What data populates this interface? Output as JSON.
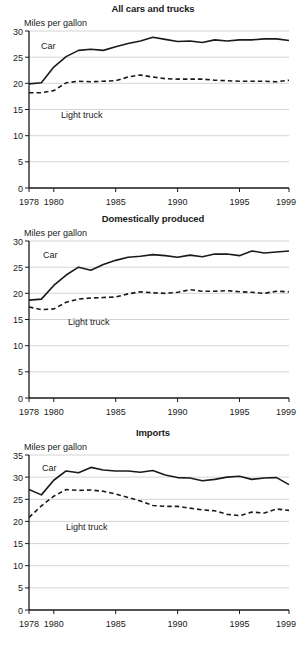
{
  "figure": {
    "panel_count": 3,
    "y_axis_title": "Miles per gallon",
    "series_names": [
      "Car",
      "Light truck"
    ],
    "colors": {
      "ink": "#1a1a1a",
      "gridline": "#c9c9c9",
      "background": "#ffffff"
    }
  },
  "chart_data": [
    {
      "type": "line",
      "title": "All cars and trucks",
      "xlabel": "",
      "ylabel": "Miles per gallon",
      "xlim": [
        1978,
        1999
      ],
      "ylim": [
        0,
        30
      ],
      "yticks": [
        0,
        5,
        10,
        15,
        20,
        25,
        30
      ],
      "xticks": [
        1978,
        1980,
        1985,
        1990,
        1995,
        1999
      ],
      "xtick_labels": [
        "1978",
        "1980",
        "1985",
        "1990",
        "1995",
        "1999"
      ],
      "ytick_labels": [
        "0",
        "5",
        "10",
        "15",
        "20",
        "25",
        "30"
      ],
      "grid": true,
      "legend": "inline-annotations",
      "x": [
        1978,
        1979,
        1980,
        1981,
        1982,
        1983,
        1984,
        1985,
        1986,
        1987,
        1988,
        1989,
        1990,
        1991,
        1992,
        1993,
        1994,
        1995,
        1996,
        1997,
        1998,
        1999
      ],
      "series": [
        {
          "name": "Car",
          "style": "solid",
          "values": [
            19.9,
            20.1,
            23.1,
            25.1,
            26.3,
            26.5,
            26.3,
            27.0,
            27.6,
            28.1,
            28.8,
            28.4,
            28.0,
            28.1,
            27.8,
            28.3,
            28.1,
            28.3,
            28.3,
            28.5,
            28.5,
            28.2
          ]
        },
        {
          "name": "Light truck",
          "style": "dashed",
          "values": [
            18.2,
            18.2,
            18.6,
            20.1,
            20.4,
            20.3,
            20.4,
            20.5,
            21.2,
            21.6,
            21.2,
            20.9,
            20.8,
            20.8,
            20.8,
            20.6,
            20.5,
            20.4,
            20.4,
            20.4,
            20.3,
            20.6
          ]
        }
      ]
    },
    {
      "type": "line",
      "title": "Domestically produced",
      "xlabel": "",
      "ylabel": "Miles per gallon",
      "xlim": [
        1978,
        1999
      ],
      "ylim": [
        0,
        30
      ],
      "yticks": [
        0,
        5,
        10,
        15,
        20,
        25,
        30
      ],
      "xticks": [
        1978,
        1980,
        1985,
        1990,
        1995,
        1999
      ],
      "xtick_labels": [
        "1978",
        "1980",
        "1985",
        "1990",
        "1995",
        "1999"
      ],
      "ytick_labels": [
        "0",
        "5",
        "10",
        "15",
        "20",
        "25",
        "30"
      ],
      "grid": true,
      "legend": "inline-annotations",
      "x": [
        1978,
        1979,
        1980,
        1981,
        1982,
        1983,
        1984,
        1985,
        1986,
        1987,
        1988,
        1989,
        1990,
        1991,
        1992,
        1993,
        1994,
        1995,
        1996,
        1997,
        1998,
        1999
      ],
      "series": [
        {
          "name": "Car",
          "style": "solid",
          "values": [
            18.7,
            18.9,
            21.5,
            23.5,
            25.0,
            24.4,
            25.5,
            26.3,
            26.9,
            27.1,
            27.4,
            27.2,
            26.9,
            27.3,
            27.0,
            27.5,
            27.5,
            27.2,
            28.1,
            27.7,
            27.9,
            28.1
          ]
        },
        {
          "name": "Light truck",
          "style": "dashed",
          "values": [
            17.4,
            16.9,
            17.0,
            18.3,
            18.9,
            19.1,
            19.2,
            19.3,
            19.9,
            20.3,
            20.1,
            20.0,
            20.2,
            20.7,
            20.4,
            20.4,
            20.5,
            20.3,
            20.2,
            20.0,
            20.4,
            20.3
          ]
        }
      ]
    },
    {
      "type": "line",
      "title": "Imports",
      "xlabel": "",
      "ylabel": "Miles per gallon",
      "xlim": [
        1978,
        1999
      ],
      "ylim": [
        0,
        35
      ],
      "yticks": [
        0,
        5,
        10,
        15,
        20,
        25,
        30,
        35
      ],
      "xticks": [
        1978,
        1980,
        1985,
        1990,
        1995,
        1999
      ],
      "xtick_labels": [
        "1978",
        "1980",
        "1985",
        "1990",
        "1995",
        "1999"
      ],
      "ytick_labels": [
        "0",
        "5",
        "10",
        "15",
        "20",
        "25",
        "30",
        "35"
      ],
      "grid": true,
      "legend": "inline-annotations",
      "x": [
        1978,
        1979,
        1980,
        1981,
        1982,
        1983,
        1984,
        1985,
        1986,
        1987,
        1988,
        1989,
        1990,
        1991,
        1992,
        1993,
        1994,
        1995,
        1996,
        1997,
        1998,
        1999
      ],
      "series": [
        {
          "name": "Car",
          "style": "solid",
          "values": [
            27.2,
            26.0,
            29.3,
            31.4,
            31.0,
            32.2,
            31.6,
            31.4,
            31.4,
            31.1,
            31.5,
            30.5,
            29.9,
            29.8,
            29.2,
            29.5,
            30.0,
            30.2,
            29.5,
            29.8,
            29.9,
            28.3
          ]
        },
        {
          "name": "Light truck",
          "style": "dashed",
          "values": [
            20.9,
            23.5,
            25.7,
            27.2,
            27.0,
            27.1,
            26.8,
            26.2,
            25.4,
            24.6,
            23.6,
            23.4,
            23.4,
            23.0,
            22.6,
            22.4,
            21.6,
            21.3,
            22.1,
            21.9,
            22.8,
            22.5
          ]
        }
      ]
    }
  ]
}
